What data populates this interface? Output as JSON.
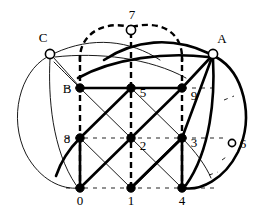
{
  "figure": {
    "title": "",
    "width": 265,
    "height": 219,
    "background": "#ffffff",
    "stroke_dark": "#000000"
  },
  "styles": {
    "thick_width": 2.6,
    "thin_width": 0.9,
    "dashed_width": 2.4,
    "grid_dash_width": 1.0,
    "dash_pattern": "6,4",
    "grid_dash_pattern": "4,5"
  },
  "chart_data": {
    "type": "diagram",
    "subtype": "lattice-graph-embedding",
    "title": "",
    "xlabel": "",
    "ylabel": "",
    "nodes": [
      {
        "id": "0",
        "label": "0",
        "x": 80,
        "y": 188,
        "style": "filled",
        "label_dx": 0,
        "label_dy": 17
      },
      {
        "id": "1",
        "label": "1",
        "x": 131,
        "y": 188,
        "style": "filled",
        "label_dx": 0,
        "label_dy": 17
      },
      {
        "id": "4",
        "label": "4",
        "x": 182,
        "y": 188,
        "style": "filled",
        "label_dx": 0,
        "label_dy": 17
      },
      {
        "id": "8",
        "label": "8",
        "x": 80,
        "y": 138,
        "style": "filled",
        "label_dx": -13,
        "label_dy": 5
      },
      {
        "id": "2",
        "label": "2",
        "x": 131,
        "y": 138,
        "style": "filled",
        "label_dx": 12,
        "label_dy": 12
      },
      {
        "id": "3",
        "label": "3",
        "x": 182,
        "y": 138,
        "style": "filled",
        "label_dx": 12,
        "label_dy": 9
      },
      {
        "id": "B",
        "label": "B",
        "x": 80,
        "y": 88,
        "style": "filled",
        "label_dx": -13,
        "label_dy": 5
      },
      {
        "id": "5",
        "label": "5",
        "x": 131,
        "y": 88,
        "style": "filled",
        "label_dx": 12,
        "label_dy": 9
      },
      {
        "id": "9",
        "label": "9",
        "x": 182,
        "y": 88,
        "style": "filled",
        "label_dx": 12,
        "label_dy": 12
      },
      {
        "id": "C",
        "label": "C",
        "x": 50,
        "y": 54,
        "style": "open",
        "label_dx": -7,
        "label_dy": -12
      },
      {
        "id": "A",
        "label": "A",
        "x": 213,
        "y": 54,
        "style": "open",
        "label_dx": 9,
        "label_dy": -11
      },
      {
        "id": "7",
        "label": "7",
        "x": 131,
        "y": 30,
        "style": "open",
        "label_dx": 1,
        "label_dy": -11
      },
      {
        "id": "6",
        "label": "6",
        "x": 232,
        "y": 143,
        "style": "open-small",
        "label_dx": 11,
        "label_dy": 5
      }
    ],
    "node_radius": {
      "filled": 4.2,
      "open": 4.6,
      "open-small": 3.6
    },
    "edge_classes": {
      "thick": "heavy solid curve / lattice NE-SW diagonal",
      "thin": "light solid curve / lattice NW-SE diagonal",
      "dashed": "heavy dashed curve through node 7",
      "grid": "light dashed lattice axis lines (horizontal and vertical)"
    },
    "legend": [],
    "annotations": []
  }
}
